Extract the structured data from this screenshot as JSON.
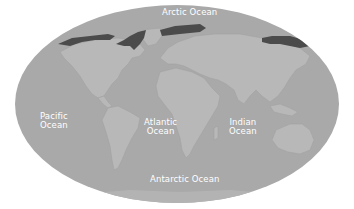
{
  "map": {
    "projection": "elliptical world map",
    "colors": {
      "ocean": "#a9a9a9",
      "land": "#b8b8b8",
      "land_edge": "#a2a2a2",
      "ice": "#4b4b4b",
      "label": "#ffffff",
      "background": "#ffffff"
    },
    "labels": [
      {
        "id": "arctic",
        "lines": [
          "Arctic Ocean"
        ]
      },
      {
        "id": "pacific",
        "lines": [
          "Pacific",
          "Ocean"
        ]
      },
      {
        "id": "atlantic",
        "lines": [
          "Atlantic",
          "Ocean"
        ]
      },
      {
        "id": "indian",
        "lines": [
          "Indian",
          "Ocean"
        ]
      },
      {
        "id": "antarctic",
        "lines": [
          "Antarctic Ocean"
        ]
      }
    ]
  }
}
